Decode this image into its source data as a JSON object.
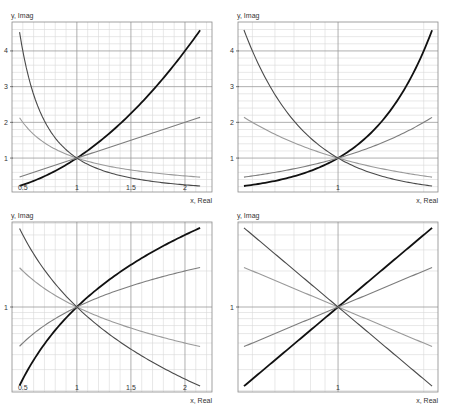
{
  "colors": {
    "frame": "#8a8a8a",
    "major_grid": "#9a9a9a",
    "minor_grid": "#d9d9d9",
    "tick_text": "#333333"
  },
  "series_styles": [
    {
      "name": "x^2",
      "color": "#111111",
      "width": 1.8
    },
    {
      "name": "x",
      "color": "#7d7d7d",
      "width": 1.1
    },
    {
      "name": "1/x",
      "color": "#9a9a9a",
      "width": 1.1
    },
    {
      "name": "1/x^2",
      "color": "#4a4a4a",
      "width": 1.1
    }
  ],
  "chart_data": [
    {
      "type": "line",
      "title": "",
      "xlabel": "x, Real",
      "ylabel": "y, Imag",
      "xscale": "linear",
      "yscale": "linear",
      "xlim": [
        0.4,
        2.25
      ],
      "ylim": [
        0.05,
        4.81
      ],
      "xticks": [
        {
          "v": 0.5,
          "label": "0.5"
        },
        {
          "v": 1,
          "label": "1"
        },
        {
          "v": 1.5,
          "label": "1.5"
        },
        {
          "v": 2,
          "label": "2"
        }
      ],
      "yticks": [
        {
          "v": 1,
          "label": "1"
        },
        {
          "v": 2,
          "label": "2"
        },
        {
          "v": 3,
          "label": "3"
        },
        {
          "v": 4,
          "label": "4"
        }
      ],
      "x_major": [
        1,
        1.5,
        2
      ],
      "x_minor": [
        0.5,
        0.6,
        0.7,
        0.8,
        0.9,
        1.1,
        1.2,
        1.3,
        1.4,
        1.6,
        1.7,
        1.8,
        1.9,
        2.1,
        2.2
      ],
      "y_major": [
        1,
        2,
        3,
        4
      ],
      "y_minor": [
        0.2,
        0.4,
        0.6,
        0.8,
        1.2,
        1.4,
        1.6,
        1.8,
        2.2,
        2.4,
        2.6,
        2.8,
        3.2,
        3.4,
        3.6,
        3.8,
        4.2,
        4.4,
        4.6
      ],
      "x_range_curves": [
        0.47,
        2.14
      ],
      "series": [
        {
          "name": "x^2",
          "expr": "x^2"
        },
        {
          "name": "x",
          "expr": "x"
        },
        {
          "name": "1/x",
          "expr": "1/x"
        },
        {
          "name": "1/x^2",
          "expr": "1/x^2"
        }
      ],
      "grid": true
    },
    {
      "type": "line",
      "title": "",
      "xlabel": "x, Real",
      "ylabel": "y, Imag",
      "xscale": "log",
      "yscale": "linear",
      "xlim": [
        0.445,
        2.245
      ],
      "ylim": [
        0.05,
        4.81
      ],
      "xticks": [
        {
          "v": 1,
          "label": "1"
        }
      ],
      "yticks": [
        {
          "v": 1,
          "label": "1"
        },
        {
          "v": 2,
          "label": "2"
        },
        {
          "v": 3,
          "label": "3"
        },
        {
          "v": 4,
          "label": "4"
        }
      ],
      "x_major": [
        1
      ],
      "x_minor": [
        0.5,
        0.6,
        0.7,
        0.8,
        0.9,
        2
      ],
      "y_major": [
        1,
        2,
        3,
        4
      ],
      "y_minor": [
        0.2,
        0.4,
        0.6,
        0.8,
        1.2,
        1.4,
        1.6,
        1.8,
        2.2,
        2.4,
        2.6,
        2.8,
        3.2,
        3.4,
        3.6,
        3.8,
        4.2,
        4.4,
        4.6
      ],
      "x_range_curves": [
        0.467,
        2.14
      ],
      "series": [
        {
          "name": "x^2",
          "expr": "x^2"
        },
        {
          "name": "x",
          "expr": "x"
        },
        {
          "name": "1/x",
          "expr": "1/x"
        },
        {
          "name": "1/x^2",
          "expr": "1/x^2"
        }
      ],
      "grid": true
    },
    {
      "type": "line",
      "title": "",
      "xlabel": "x, Real",
      "ylabel": "y, Imag",
      "xscale": "linear",
      "yscale": "log",
      "xlim": [
        0.4,
        2.25
      ],
      "ylim": [
        0.195,
        5.13
      ],
      "xticks": [
        {
          "v": 0.5,
          "label": "0.5"
        },
        {
          "v": 1,
          "label": "1"
        },
        {
          "v": 1.5,
          "label": "1.5"
        },
        {
          "v": 2,
          "label": "2"
        }
      ],
      "yticks": [
        {
          "v": 1,
          "label": "1"
        }
      ],
      "x_major": [
        1,
        1.5,
        2
      ],
      "x_minor": [
        0.5,
        0.6,
        0.7,
        0.8,
        0.9,
        1.1,
        1.2,
        1.3,
        1.4,
        1.6,
        1.7,
        1.8,
        1.9,
        2.1,
        2.2
      ],
      "y_major": [
        1
      ],
      "y_minor": [
        0.2,
        0.3,
        0.4,
        0.5,
        0.6,
        0.7,
        0.8,
        0.9,
        2,
        3,
        4,
        5
      ],
      "x_range_curves": [
        0.47,
        2.14
      ],
      "series": [
        {
          "name": "x^2",
          "expr": "x^2"
        },
        {
          "name": "x",
          "expr": "x"
        },
        {
          "name": "1/x",
          "expr": "1/x"
        },
        {
          "name": "1/x^2",
          "expr": "1/x^2"
        }
      ],
      "grid": true
    },
    {
      "type": "line",
      "title": "",
      "xlabel": "x, Real",
      "ylabel": "y, Imag",
      "xscale": "log",
      "yscale": "log",
      "xlim": [
        0.445,
        2.245
      ],
      "ylim": [
        0.195,
        5.13
      ],
      "xticks": [
        {
          "v": 1,
          "label": "1"
        }
      ],
      "yticks": [
        {
          "v": 1,
          "label": "1"
        }
      ],
      "x_major": [
        1
      ],
      "x_minor": [
        0.5,
        0.6,
        0.7,
        0.8,
        0.9,
        2
      ],
      "y_major": [
        1
      ],
      "y_minor": [
        0.2,
        0.3,
        0.4,
        0.5,
        0.6,
        0.7,
        0.8,
        0.9,
        2,
        3,
        4,
        5
      ],
      "x_range_curves": [
        0.467,
        2.14
      ],
      "series": [
        {
          "name": "x^2",
          "expr": "x^2"
        },
        {
          "name": "x",
          "expr": "x"
        },
        {
          "name": "1/x",
          "expr": "1/x"
        },
        {
          "name": "1/x^2",
          "expr": "1/x^2"
        }
      ],
      "grid": true
    }
  ]
}
